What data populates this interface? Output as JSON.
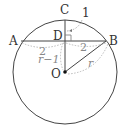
{
  "diagram": {
    "type": "circle-chord-geometry",
    "colors": {
      "stroke": "#444444",
      "annotation": "#999999",
      "background": "#ffffff"
    },
    "points": {
      "A": "A",
      "B": "B",
      "C": "C",
      "D": "D",
      "O": "O"
    },
    "measurements": {
      "CD": "1",
      "AD": "2",
      "DB": "2",
      "OD": "r−1",
      "OB": "r"
    }
  }
}
